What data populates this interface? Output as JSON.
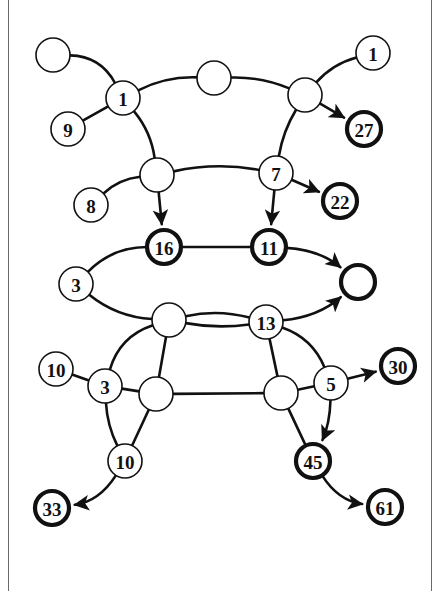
{
  "diagram": {
    "type": "graph",
    "node_radius": 17,
    "nodes": [
      {
        "id": "n_tl",
        "label": "",
        "x": 53,
        "y": 55,
        "style": "normal"
      },
      {
        "id": "n_1a",
        "label": "1",
        "x": 123,
        "y": 98,
        "style": "normal"
      },
      {
        "id": "n_9",
        "label": "9",
        "x": 68,
        "y": 129,
        "style": "normal"
      },
      {
        "id": "n_tm",
        "label": "",
        "x": 214,
        "y": 78,
        "style": "normal"
      },
      {
        "id": "n_tr",
        "label": "",
        "x": 305,
        "y": 95,
        "style": "normal"
      },
      {
        "id": "n_1b",
        "label": "1",
        "x": 373,
        "y": 53,
        "style": "normal"
      },
      {
        "id": "n_27",
        "label": "27",
        "x": 364,
        "y": 129,
        "style": "bold"
      },
      {
        "id": "n_ml",
        "label": "",
        "x": 157,
        "y": 175,
        "style": "normal"
      },
      {
        "id": "n_7",
        "label": "7",
        "x": 276,
        "y": 173,
        "style": "normal"
      },
      {
        "id": "n_8",
        "label": "8",
        "x": 91,
        "y": 205,
        "style": "normal"
      },
      {
        "id": "n_22",
        "label": "22",
        "x": 340,
        "y": 201,
        "style": "bold"
      },
      {
        "id": "n_16",
        "label": "16",
        "x": 164,
        "y": 247,
        "style": "bold"
      },
      {
        "id": "n_11",
        "label": "11",
        "x": 269,
        "y": 247,
        "style": "bold"
      },
      {
        "id": "n_3a",
        "label": "3",
        "x": 76,
        "y": 284,
        "style": "normal"
      },
      {
        "id": "n_rb",
        "label": "",
        "x": 358,
        "y": 282,
        "style": "bold"
      },
      {
        "id": "n_cl",
        "label": "",
        "x": 169,
        "y": 320,
        "style": "normal"
      },
      {
        "id": "n_13",
        "label": "13",
        "x": 266,
        "y": 322,
        "style": "normal"
      },
      {
        "id": "n_10a",
        "label": "10",
        "x": 56,
        "y": 369,
        "style": "normal"
      },
      {
        "id": "n_3b",
        "label": "3",
        "x": 105,
        "y": 386,
        "style": "normal"
      },
      {
        "id": "n_ll",
        "label": "",
        "x": 156,
        "y": 394,
        "style": "normal"
      },
      {
        "id": "n_lr",
        "label": "",
        "x": 281,
        "y": 393,
        "style": "normal"
      },
      {
        "id": "n_5",
        "label": "5",
        "x": 331,
        "y": 383,
        "style": "normal"
      },
      {
        "id": "n_30",
        "label": "30",
        "x": 398,
        "y": 366,
        "style": "bold"
      },
      {
        "id": "n_10b",
        "label": "10",
        "x": 125,
        "y": 461,
        "style": "normal"
      },
      {
        "id": "n_45",
        "label": "45",
        "x": 313,
        "y": 461,
        "style": "bold"
      },
      {
        "id": "n_33",
        "label": "33",
        "x": 52,
        "y": 508,
        "style": "bold"
      },
      {
        "id": "n_61",
        "label": "61",
        "x": 385,
        "y": 507,
        "style": "bold"
      }
    ],
    "edges": [
      {
        "from": "n_tl",
        "to": "n_1a",
        "bend": -12,
        "arrow": false
      },
      {
        "from": "n_9",
        "to": "n_1a",
        "bend": 0,
        "arrow": false
      },
      {
        "from": "n_1a",
        "to": "n_tm",
        "bend": -6,
        "arrow": false
      },
      {
        "from": "n_tm",
        "to": "n_tr",
        "bend": -5,
        "arrow": false
      },
      {
        "from": "n_1b",
        "to": "n_tr",
        "bend": 6,
        "arrow": false
      },
      {
        "from": "n_tr",
        "to": "n_27",
        "bend": 0,
        "arrow": true
      },
      {
        "from": "n_1a",
        "to": "n_ml",
        "bend": -6,
        "arrow": false
      },
      {
        "from": "n_tr",
        "to": "n_7",
        "bend": 4,
        "arrow": false
      },
      {
        "from": "n_ml",
        "to": "n_7",
        "bend": -6,
        "arrow": false
      },
      {
        "from": "n_8",
        "to": "n_ml",
        "bend": -6,
        "arrow": false
      },
      {
        "from": "n_7",
        "to": "n_22",
        "bend": 0,
        "arrow": true
      },
      {
        "from": "n_ml",
        "to": "n_16",
        "bend": 0,
        "arrow": true
      },
      {
        "from": "n_7",
        "to": "n_11",
        "bend": 0,
        "arrow": true
      },
      {
        "from": "n_3a",
        "to": "n_16",
        "bend": -10,
        "arrow": false
      },
      {
        "from": "n_16",
        "to": "n_11",
        "bend": 0,
        "arrow": false
      },
      {
        "from": "n_11",
        "to": "n_rb",
        "bend": -8,
        "arrow": true
      },
      {
        "from": "n_3a",
        "to": "n_cl",
        "bend": 8,
        "arrow": false
      },
      {
        "from": "n_cl",
        "to": "n_13",
        "bend": -6,
        "arrow": false
      },
      {
        "from": "n_cl",
        "to": "n_13",
        "bend": 4,
        "arrow": false
      },
      {
        "from": "n_13",
        "to": "n_rb",
        "bend": 8,
        "arrow": true
      },
      {
        "from": "n_cl",
        "to": "n_3b",
        "bend": 12,
        "arrow": false
      },
      {
        "from": "n_cl",
        "to": "n_ll",
        "bend": 0,
        "arrow": false
      },
      {
        "from": "n_13",
        "to": "n_lr",
        "bend": 0,
        "arrow": false
      },
      {
        "from": "n_13",
        "to": "n_5",
        "bend": -10,
        "arrow": false
      },
      {
        "from": "n_10a",
        "to": "n_3b",
        "bend": 0,
        "arrow": false
      },
      {
        "from": "n_3b",
        "to": "n_ll",
        "bend": 0,
        "arrow": false
      },
      {
        "from": "n_ll",
        "to": "n_lr",
        "bend": 0,
        "arrow": false
      },
      {
        "from": "n_lr",
        "to": "n_5",
        "bend": 0,
        "arrow": false
      },
      {
        "from": "n_5",
        "to": "n_30",
        "bend": 0,
        "arrow": true
      },
      {
        "from": "n_5",
        "to": "n_45",
        "bend": -4,
        "arrow": true
      },
      {
        "from": "n_3b",
        "to": "n_10b",
        "bend": 4,
        "arrow": false
      },
      {
        "from": "n_ll",
        "to": "n_10b",
        "bend": 0,
        "arrow": false
      },
      {
        "from": "n_lr",
        "to": "n_45",
        "bend": 0,
        "arrow": false
      },
      {
        "from": "n_10b",
        "to": "n_33",
        "bend": -10,
        "arrow": true
      },
      {
        "from": "n_45",
        "to": "n_61",
        "bend": 10,
        "arrow": true
      }
    ]
  }
}
